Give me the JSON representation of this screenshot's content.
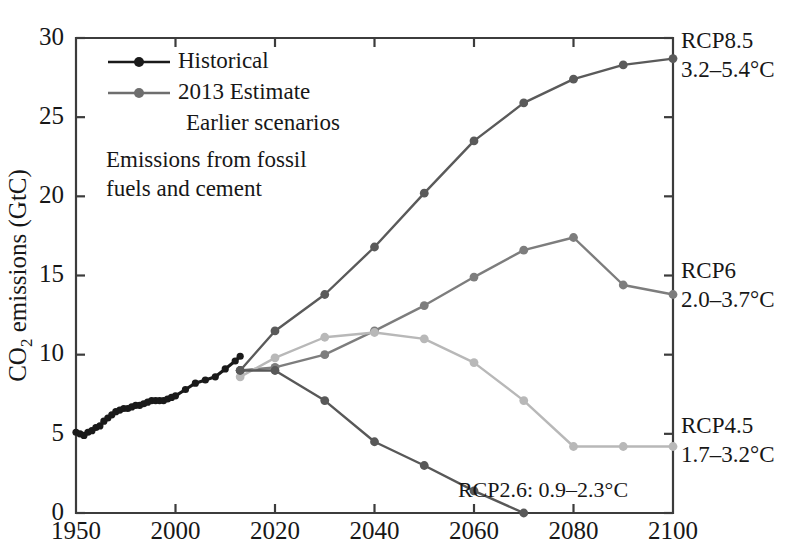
{
  "figure": {
    "background": "#ffffff",
    "ylabel_main": "CO",
    "ylabel_sub": "2",
    "ylabel_rest": " emissions (GtC)"
  },
  "legend": {
    "items": [
      {
        "label": "Historical",
        "color": "#1a1a1a",
        "marker": true
      },
      {
        "label": "2013 Estimate",
        "color": "#6e6e6e",
        "marker": true
      },
      {
        "label": "Earlier scenarios",
        "color": "#1a1a1a",
        "marker": false
      }
    ]
  },
  "annotation": {
    "line1": "Emissions from fossil",
    "line2": "fuels and cement"
  },
  "side_labels": [
    {
      "name": "RCP8.5",
      "range": "3.2–5.4°C",
      "color": "#5a5a5a",
      "y": 48
    },
    {
      "name": "RCP6",
      "range": "2.0–3.7°C",
      "color": "#7d7d7d",
      "y": 278
    },
    {
      "name": "RCP4.5",
      "range": "1.7–3.2°C",
      "color": "#b4b4b4",
      "y": 433
    }
  ],
  "inline_label": {
    "text": "RCP2.6: 0.9–2.3°C",
    "color": "#9a9a9a"
  },
  "chart_data": {
    "type": "line",
    "title": "",
    "xlabel": "",
    "ylabel": "CO2 emissions (GtC)",
    "xlim": [
      1950,
      2100
    ],
    "ylim": [
      0,
      30
    ],
    "yticks": [
      0,
      5,
      10,
      15,
      20,
      25,
      30
    ],
    "xticks": [
      1950,
      2000,
      2020,
      2040,
      2060,
      2080,
      2100
    ],
    "x_axis_note": "piecewise axis: 1950-2000 occupies same width as each 20-year interval after 2000",
    "grid": false,
    "legend_position": "upper-left",
    "series": [
      {
        "name": "Historical",
        "color": "#1a1a1a",
        "marker": "circle",
        "x": [
          1950,
          1952,
          1954,
          1956,
          1958,
          1960,
          1962,
          1964,
          1966,
          1968,
          1970,
          1972,
          1974,
          1976,
          1978,
          1980,
          1982,
          1984,
          1986,
          1988,
          1990,
          1992,
          1994,
          1996,
          1998,
          2000,
          2002,
          2004,
          2006,
          2008,
          2010,
          2012,
          2013
        ],
        "y": [
          5.1,
          5.0,
          4.9,
          5.1,
          5.2,
          5.4,
          5.5,
          5.8,
          6.0,
          6.2,
          6.4,
          6.5,
          6.6,
          6.6,
          6.7,
          6.8,
          6.8,
          6.9,
          7.0,
          7.1,
          7.1,
          7.1,
          7.1,
          7.2,
          7.3,
          7.4,
          7.8,
          8.2,
          8.4,
          8.6,
          9.1,
          9.6,
          9.9
        ]
      },
      {
        "name": "RCP8.5",
        "color": "#5a5a5a",
        "marker": "circle",
        "x": [
          2013,
          2020,
          2030,
          2040,
          2050,
          2060,
          2070,
          2080,
          2090,
          2100
        ],
        "y": [
          9.0,
          11.5,
          13.8,
          16.8,
          20.2,
          23.5,
          25.9,
          27.4,
          28.3,
          28.7
        ]
      },
      {
        "name": "RCP6",
        "color": "#7d7d7d",
        "marker": "circle",
        "x": [
          2013,
          2020,
          2030,
          2040,
          2050,
          2060,
          2070,
          2080,
          2090,
          2100
        ],
        "y": [
          9.0,
          9.2,
          10.0,
          11.5,
          13.1,
          14.9,
          16.6,
          17.4,
          14.4,
          13.8
        ]
      },
      {
        "name": "RCP4.5",
        "color": "#b8b8b8",
        "marker": "circle",
        "x": [
          2013,
          2020,
          2030,
          2040,
          2050,
          2060,
          2070,
          2080,
          2090,
          2100
        ],
        "y": [
          8.6,
          9.8,
          11.1,
          11.4,
          11.0,
          9.5,
          7.1,
          4.2,
          4.2,
          4.2
        ]
      },
      {
        "name": "RCP2.6",
        "color": "#585858",
        "marker": "circle",
        "x": [
          2013,
          2020,
          2030,
          2040,
          2050,
          2060,
          2070
        ],
        "y": [
          9.0,
          9.0,
          7.1,
          4.5,
          3.0,
          1.4,
          0.0
        ]
      }
    ]
  }
}
